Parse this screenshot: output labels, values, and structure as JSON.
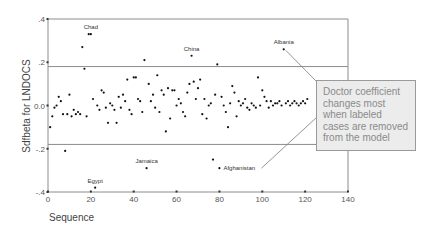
{
  "chart_data": {
    "type": "scatter",
    "title": "",
    "xlabel": "Sequence",
    "ylabel": "Sdfbeta for LNDOCS",
    "xlim": [
      0,
      140
    ],
    "ylim": [
      -0.4,
      0.4
    ],
    "x_ticks": [
      0,
      20,
      40,
      60,
      80,
      100,
      120,
      140
    ],
    "y_ticks": [
      {
        "value": 0.4,
        "label": ".4"
      },
      {
        "value": 0.2,
        "label": ".2"
      },
      {
        "value": 0.0,
        "label": "0.0"
      },
      {
        "value": -0.2,
        "label": "-.2"
      },
      {
        "value": -0.4,
        "label": "-.4"
      }
    ],
    "grid": false,
    "reference_lines": [
      0.18,
      -0.18
    ],
    "labeled_points": [
      {
        "label": "Chad",
        "x": 20,
        "y": 0.33
      },
      {
        "label": "China",
        "x": 67,
        "y": 0.23
      },
      {
        "label": "Albania",
        "x": 110,
        "y": 0.26
      },
      {
        "label": "Jamaica",
        "x": 46,
        "y": -0.29
      },
      {
        "label": "Afghanistan",
        "x": 80,
        "y": -0.29
      },
      {
        "label": "Egypt",
        "x": 22,
        "y": -0.38
      }
    ],
    "points": [
      [
        1,
        -0.1
      ],
      [
        2,
        -0.05
      ],
      [
        3,
        -0.01
      ],
      [
        4,
        0.0
      ],
      [
        5,
        0.04
      ],
      [
        6,
        0.02
      ],
      [
        7,
        -0.04
      ],
      [
        8,
        -0.21
      ],
      [
        9,
        -0.04
      ],
      [
        10,
        0.05
      ],
      [
        11,
        -0.05
      ],
      [
        12,
        -0.02
      ],
      [
        13,
        -0.04
      ],
      [
        14,
        -0.03
      ],
      [
        15,
        -0.04
      ],
      [
        16,
        0.27
      ],
      [
        17,
        0.17
      ],
      [
        18,
        -0.05
      ],
      [
        19,
        0.33
      ],
      [
        20,
        0.33
      ],
      [
        21,
        0.03
      ],
      [
        22,
        -0.38
      ],
      [
        23,
        0.0
      ],
      [
        24,
        -0.02
      ],
      [
        25,
        0.07
      ],
      [
        26,
        0.06
      ],
      [
        27,
        -0.01
      ],
      [
        28,
        -0.08
      ],
      [
        29,
        0.01
      ],
      [
        30,
        0.0
      ],
      [
        31,
        -0.02
      ],
      [
        32,
        -0.08
      ],
      [
        33,
        0.04
      ],
      [
        34,
        -0.01
      ],
      [
        35,
        0.05
      ],
      [
        36,
        0.02
      ],
      [
        37,
        0.12
      ],
      [
        38,
        -0.02
      ],
      [
        39,
        -0.04
      ],
      [
        40,
        0.13
      ],
      [
        41,
        0.13
      ],
      [
        42,
        0.03
      ],
      [
        43,
        0.02
      ],
      [
        44,
        -0.03
      ],
      [
        45,
        0.21
      ],
      [
        46,
        -0.29
      ],
      [
        47,
        0.1
      ],
      [
        48,
        0.02
      ],
      [
        49,
        0.05
      ],
      [
        50,
        -0.01
      ],
      [
        51,
        0.14
      ],
      [
        52,
        -0.03
      ],
      [
        53,
        0.07
      ],
      [
        54,
        0.05
      ],
      [
        55,
        -0.12
      ],
      [
        56,
        0.08
      ],
      [
        57,
        -0.06
      ],
      [
        58,
        0.07
      ],
      [
        59,
        0.07
      ],
      [
        60,
        0.0
      ],
      [
        61,
        0.03
      ],
      [
        62,
        0.01
      ],
      [
        63,
        -0.03
      ],
      [
        64,
        -0.05
      ],
      [
        65,
        0.06
      ],
      [
        66,
        0.1
      ],
      [
        67,
        0.23
      ],
      [
        68,
        0.11
      ],
      [
        69,
        0.03
      ],
      [
        70,
        0.08
      ],
      [
        71,
        0.12
      ],
      [
        72,
        -0.04
      ],
      [
        73,
        0.03
      ],
      [
        74,
        -0.06
      ],
      [
        75,
        0.0
      ],
      [
        76,
        0.01
      ],
      [
        77,
        -0.25
      ],
      [
        78,
        0.05
      ],
      [
        79,
        0.19
      ],
      [
        80,
        -0.29
      ],
      [
        81,
        0.04
      ],
      [
        82,
        0.0
      ],
      [
        83,
        -0.03
      ],
      [
        84,
        -0.1
      ],
      [
        85,
        0.01
      ],
      [
        86,
        0.09
      ],
      [
        87,
        0.06
      ],
      [
        88,
        -0.05
      ],
      [
        89,
        0.02
      ],
      [
        90,
        0.0
      ],
      [
        91,
        0.01
      ],
      [
        92,
        0.03
      ],
      [
        93,
        -0.01
      ],
      [
        94,
        -0.02
      ],
      [
        95,
        0.01
      ],
      [
        96,
        0.0
      ],
      [
        97,
        -0.01
      ],
      [
        98,
        0.13
      ],
      [
        99,
        0.0
      ],
      [
        100,
        0.07
      ],
      [
        101,
        0.04
      ],
      [
        102,
        0.02
      ],
      [
        103,
        -0.01
      ],
      [
        104,
        0.02
      ],
      [
        105,
        0.0
      ],
      [
        106,
        0.01
      ],
      [
        107,
        0.01
      ],
      [
        108,
        0.02
      ],
      [
        109,
        0.0
      ],
      [
        110,
        0.26
      ],
      [
        111,
        0.01
      ],
      [
        112,
        0.02
      ],
      [
        113,
        0.0
      ],
      [
        114,
        0.01
      ],
      [
        115,
        0.02
      ],
      [
        116,
        0.01
      ],
      [
        117,
        0.0
      ],
      [
        118,
        0.01
      ],
      [
        119,
        0.02
      ],
      [
        120,
        0.01
      ],
      [
        121,
        0.03
      ]
    ],
    "annotation": "Doctor coefficient changes most when labeled cases are removed from the model"
  },
  "callout": {
    "text": "Doctor coefficient changes most when labeled cases are removed from the model"
  }
}
